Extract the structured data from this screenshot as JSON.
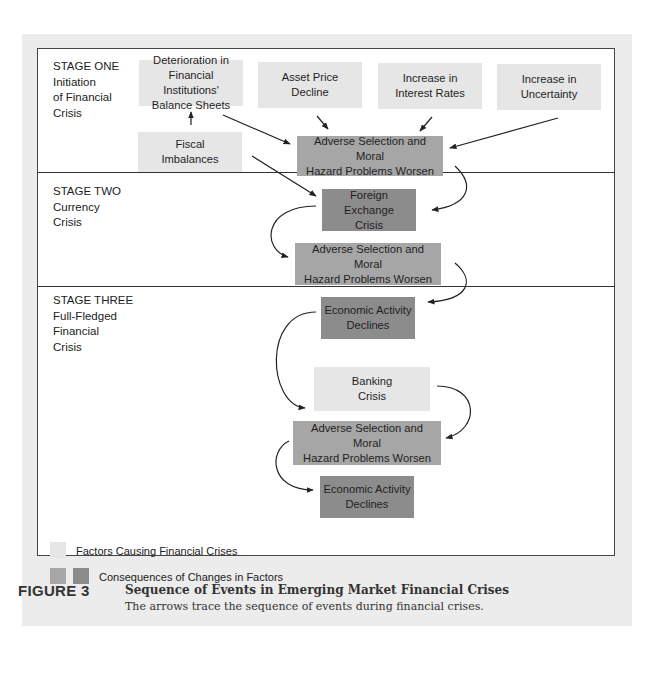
{
  "stages": [
    {
      "label": "STAGE ONE",
      "lines": [
        "Initiation",
        "of Financial",
        "Crisis"
      ]
    },
    {
      "label": "STAGE TWO",
      "lines": [
        "Currency",
        "Crisis"
      ]
    },
    {
      "label": "STAGE THREE",
      "lines": [
        "Full-Fledged",
        "Financial",
        "Crisis"
      ]
    }
  ],
  "boxes": {
    "deterioration": {
      "lines": [
        "Deterioration in",
        "Financial Institutions'",
        "Balance Sheets"
      ],
      "type": "factor"
    },
    "asset_price": {
      "lines": [
        "Asset Price",
        "Decline"
      ],
      "type": "factor"
    },
    "interest_rates": {
      "lines": [
        "Increase in",
        "Interest Rates"
      ],
      "type": "factor"
    },
    "uncertainty": {
      "lines": [
        "Increase in",
        "Uncertainty"
      ],
      "type": "factor"
    },
    "fiscal": {
      "lines": [
        "Fiscal",
        "Imbalances"
      ],
      "type": "factor"
    },
    "adverse1": {
      "lines": [
        "Adverse Selection and Moral",
        "Hazard Problems Worsen"
      ],
      "type": "consequence"
    },
    "forex": {
      "lines": [
        "Foreign Exchange",
        "Crisis"
      ],
      "type": "consequence"
    },
    "adverse2": {
      "lines": [
        "Adverse Selection and Moral",
        "Hazard Problems Worsen"
      ],
      "type": "consequence"
    },
    "econ1": {
      "lines": [
        "Economic Activity",
        "Declines"
      ],
      "type": "consequence"
    },
    "banking": {
      "lines": [
        "Banking",
        "Crisis"
      ],
      "type": "factor"
    },
    "adverse3": {
      "lines": [
        "Adverse Selection and Moral",
        "Hazard Problems Worsen"
      ],
      "type": "consequence"
    },
    "econ2": {
      "lines": [
        "Economic Activity",
        "Declines"
      ],
      "type": "consequence"
    }
  },
  "edges": [
    [
      "fiscal",
      "deterioration"
    ],
    [
      "deterioration",
      "adverse1"
    ],
    [
      "asset_price",
      "adverse1"
    ],
    [
      "interest_rates",
      "adverse1"
    ],
    [
      "uncertainty",
      "adverse1"
    ],
    [
      "fiscal",
      "forex"
    ],
    [
      "adverse1",
      "forex"
    ],
    [
      "forex",
      "adverse2"
    ],
    [
      "adverse2",
      "econ1"
    ],
    [
      "econ1",
      "banking"
    ],
    [
      "banking",
      "adverse3"
    ],
    [
      "adverse3",
      "econ2"
    ]
  ],
  "legend": {
    "factors": "Factors Causing Financial Crises",
    "consequences": "Consequences of Changes in Factors"
  },
  "colors": {
    "factor": "#e6e6e6",
    "consequence_mid": "#a6a6a6",
    "consequence_dark": "#8c8c8c"
  },
  "caption": {
    "label": "FIGURE 3",
    "title": "Sequence of Events in Emerging Market Financial Crises",
    "subtitle": "The arrows trace the sequence of events during financial crises."
  }
}
